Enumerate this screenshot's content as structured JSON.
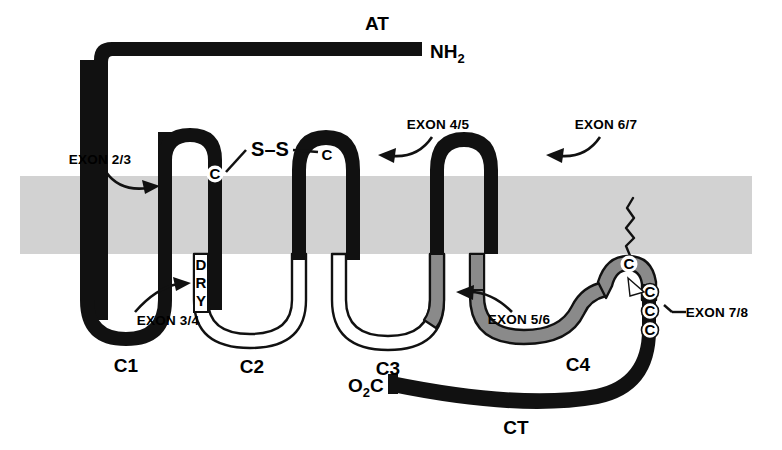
{
  "figure": {
    "type": "membrane-topology-diagram",
    "background_color": "#ffffff",
    "membrane_color": "#d2d2d2",
    "chain_black": "#111111",
    "chain_gray": "#8a8a8a",
    "chain_white": "#ffffff"
  },
  "terminals": {
    "n_terminus_label": "NH",
    "n_terminus_sub": "2",
    "c_terminus_label": "C",
    "c_terminus_pre": "O",
    "c_terminus_pre_sub": "2",
    "receptor_label": "AT"
  },
  "exon_boundaries": [
    {
      "id": "exon-2-3",
      "label": "EXON 2/3"
    },
    {
      "id": "exon-3-4",
      "label": "EXON 3/4"
    },
    {
      "id": "exon-4-5",
      "label": "EXON 4/5"
    },
    {
      "id": "exon-5-6",
      "label": "EXON 5/6"
    },
    {
      "id": "exon-6-7",
      "label": "EXON 6/7"
    },
    {
      "id": "exon-7-8",
      "label": "EXON 7/8"
    }
  ],
  "intracellular_loops": [
    {
      "id": "c1",
      "label": "C1"
    },
    {
      "id": "c2",
      "label": "C2"
    },
    {
      "id": "c3",
      "label": "C3"
    },
    {
      "id": "c4",
      "label": "C4"
    },
    {
      "id": "ct",
      "label": "CT"
    }
  ],
  "motifs": {
    "dry": [
      "D",
      "R",
      "Y"
    ],
    "disulfide_label": "S–S",
    "cysteines": [
      "C",
      "C",
      "C",
      "C",
      "C",
      "C"
    ]
  },
  "residue_markers": {
    "cys_tm3": "C",
    "cys_ec2": "C",
    "cys_palmitoyl": "C",
    "cys_tail_1": "C",
    "cys_tail_2": "C",
    "cys_tail_3": "C"
  }
}
